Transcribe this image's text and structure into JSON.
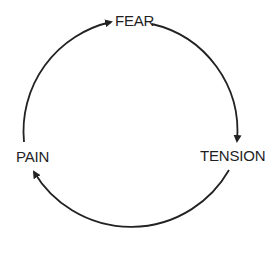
{
  "diagram": {
    "type": "cycle",
    "stroke_color": "#222222",
    "text_color": "#1f1f1f",
    "nodes": [
      {
        "id": "fear",
        "label": "FEAR"
      },
      {
        "id": "tension",
        "label": "TENSION"
      },
      {
        "id": "pain",
        "label": "PAIN"
      }
    ],
    "edges": [
      {
        "from": "fear",
        "to": "tension"
      },
      {
        "from": "tension",
        "to": "pain"
      },
      {
        "from": "pain",
        "to": "fear"
      }
    ]
  }
}
